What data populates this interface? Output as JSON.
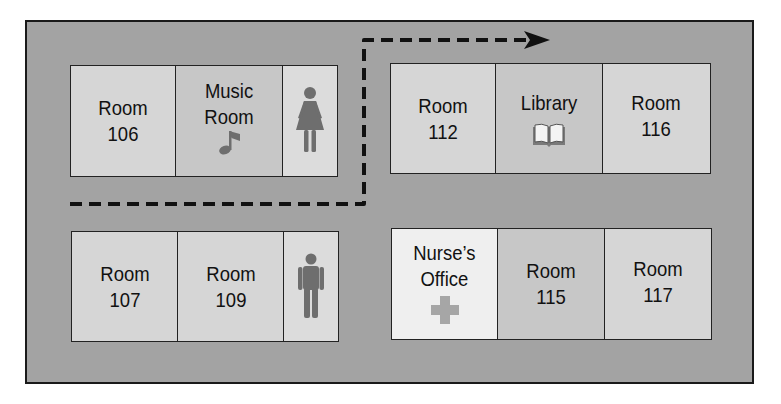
{
  "diagram": {
    "type": "floor-plan",
    "colors": {
      "hallway": "#a3a3a3",
      "room": "#d6d6d6",
      "special_room": "#c7c7c7",
      "nurse_room": "#efefef",
      "icon": "#6e6e6e",
      "border": "#1a1a1a"
    },
    "blocks": [
      {
        "id": "top-left",
        "cells": [
          {
            "line1": "Room",
            "line2": "106",
            "icon": null
          },
          {
            "line1": "Music",
            "line2": "Room",
            "icon": "music-note-icon"
          },
          {
            "line1": "",
            "line2": "",
            "icon": "womens-restroom-icon"
          }
        ]
      },
      {
        "id": "top-right",
        "cells": [
          {
            "line1": "Room",
            "line2": "112",
            "icon": null
          },
          {
            "line1": "Library",
            "line2": "",
            "icon": "book-icon"
          },
          {
            "line1": "Room",
            "line2": "116",
            "icon": null
          }
        ]
      },
      {
        "id": "bottom-left",
        "cells": [
          {
            "line1": "Room",
            "line2": "107",
            "icon": null
          },
          {
            "line1": "Room",
            "line2": "109",
            "icon": null
          },
          {
            "line1": "",
            "line2": "",
            "icon": "mens-restroom-icon"
          }
        ]
      },
      {
        "id": "bottom-right",
        "cells": [
          {
            "line1": "Nurse’s",
            "line2": "Office",
            "icon": "medical-cross-icon"
          },
          {
            "line1": "Room",
            "line2": "115",
            "icon": null
          },
          {
            "line1": "Room",
            "line2": "117",
            "icon": null
          }
        ]
      }
    ],
    "route": {
      "style": "dashed",
      "points": [
        [
          70,
          204
        ],
        [
          365,
          204
        ],
        [
          365,
          40
        ],
        [
          548,
          40
        ]
      ],
      "end": "arrow-right"
    }
  }
}
